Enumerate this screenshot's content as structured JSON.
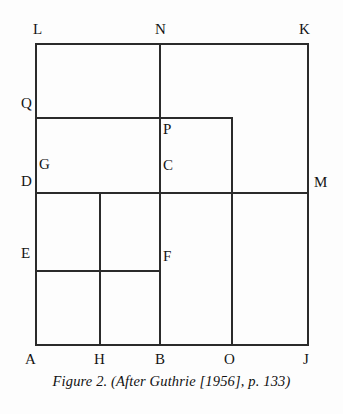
{
  "figure": {
    "caption": "Figure 2.  (After Guthrie [1956], p. 133)",
    "background_color": "#fdfdfd",
    "line_color": "#2b2b2b",
    "label_color": "#141414",
    "canvas": {
      "width": 343,
      "height": 414
    }
  },
  "geometry": {
    "description": "Nested rectangles dissection diagram with labelled vertices",
    "bounds": {
      "left": 36,
      "right": 308,
      "top": 44,
      "bottom": 345
    },
    "segments": [
      {
        "name": "outer-top-LK",
        "x1": 36,
        "y1": 44,
        "x2": 308,
        "y2": 44
      },
      {
        "name": "outer-left-LA",
        "x1": 36,
        "y1": 44,
        "x2": 36,
        "y2": 345
      },
      {
        "name": "outer-right-KJ",
        "x1": 308,
        "y1": 44,
        "x2": 308,
        "y2": 345
      },
      {
        "name": "outer-bottom-AJ",
        "x1": 36,
        "y1": 345,
        "x2": 308,
        "y2": 345
      },
      {
        "name": "vertical-NB",
        "x1": 160,
        "y1": 44,
        "x2": 160,
        "y2": 345
      },
      {
        "name": "horizontal-QP-to-right",
        "x1": 36,
        "y1": 118,
        "x2": 232,
        "y2": 118
      },
      {
        "name": "vertical-PO",
        "x1": 232,
        "y1": 118,
        "x2": 232,
        "y2": 345
      },
      {
        "name": "horizontal-DM",
        "x1": 36,
        "y1": 193,
        "x2": 308,
        "y2": 193
      },
      {
        "name": "vertical-HH",
        "x1": 100,
        "y1": 193,
        "x2": 100,
        "y2": 345
      },
      {
        "name": "horizontal-EF",
        "x1": 36,
        "y1": 271,
        "x2": 160,
        "y2": 271
      }
    ],
    "vertices": [
      {
        "id": "L",
        "label": "L",
        "x": 33,
        "y": 22,
        "anchor": "top-left-outside"
      },
      {
        "id": "N",
        "label": "N",
        "x": 155,
        "y": 22,
        "anchor": "top-outside"
      },
      {
        "id": "K",
        "label": "K",
        "x": 299,
        "y": 22,
        "anchor": "top-right-outside"
      },
      {
        "id": "Q",
        "label": "Q",
        "x": 21,
        "y": 96,
        "anchor": "left-outside"
      },
      {
        "id": "P",
        "label": "P",
        "x": 163,
        "y": 122,
        "anchor": "inside-right"
      },
      {
        "id": "G",
        "label": "G",
        "x": 39,
        "y": 157,
        "anchor": "inside-right"
      },
      {
        "id": "C",
        "label": "C",
        "x": 163,
        "y": 158,
        "anchor": "inside-right"
      },
      {
        "id": "D",
        "label": "D",
        "x": 21,
        "y": 174,
        "anchor": "left-outside"
      },
      {
        "id": "M",
        "label": "M",
        "x": 314,
        "y": 175,
        "anchor": "right-outside"
      },
      {
        "id": "E",
        "label": "E",
        "x": 21,
        "y": 246,
        "anchor": "left-outside"
      },
      {
        "id": "F",
        "label": "F",
        "x": 163,
        "y": 249,
        "anchor": "inside-right"
      },
      {
        "id": "A",
        "label": "A",
        "x": 25,
        "y": 352,
        "anchor": "bottom-outside"
      },
      {
        "id": "H",
        "label": "H",
        "x": 94,
        "y": 352,
        "anchor": "bottom-outside"
      },
      {
        "id": "B",
        "label": "B",
        "x": 155,
        "y": 352,
        "anchor": "bottom-outside"
      },
      {
        "id": "O",
        "label": "O",
        "x": 224,
        "y": 352,
        "anchor": "bottom-outside"
      },
      {
        "id": "J",
        "label": "J",
        "x": 303,
        "y": 352,
        "anchor": "bottom-outside"
      }
    ]
  }
}
